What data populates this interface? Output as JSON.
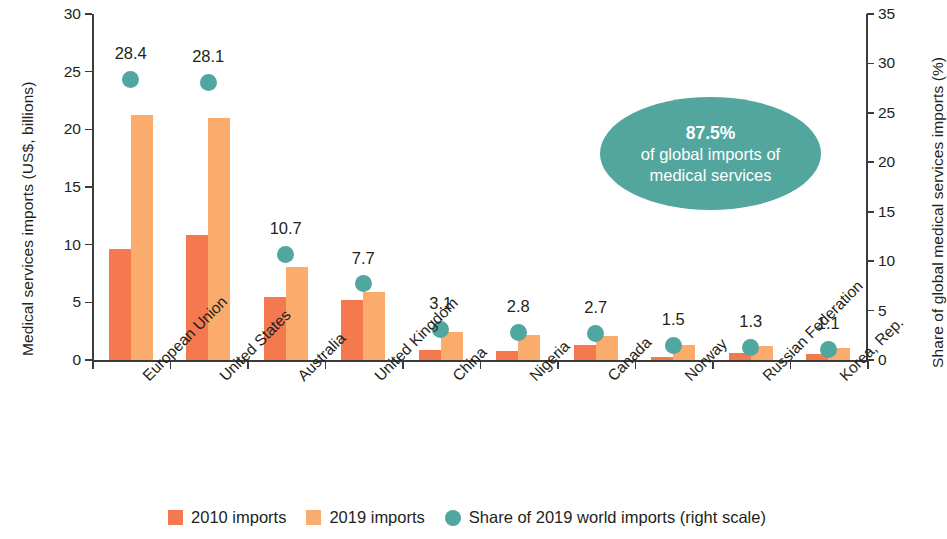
{
  "chart_data": {
    "type": "bar",
    "title": "",
    "subtitle": "",
    "categories": [
      "European Union",
      "United States",
      "Australia",
      "United Kingdom",
      "China",
      "Nigeria",
      "Canada",
      "Norway",
      "Russian Federation",
      "Korea, Rep."
    ],
    "series": [
      {
        "name": "2010 imports",
        "axis": "left",
        "color": "#f4794f",
        "values": [
          9.6,
          10.8,
          5.5,
          5.2,
          0.9,
          0.8,
          1.3,
          0.3,
          0.6,
          0.5
        ]
      },
      {
        "name": "2019 imports",
        "axis": "left",
        "color": "#fbab6b",
        "values": [
          21.2,
          21.0,
          8.1,
          5.9,
          2.4,
          2.2,
          2.1,
          1.3,
          1.2,
          1.0
        ]
      },
      {
        "name": "Share of 2019 world imports (right scale)",
        "axis": "right",
        "color": "#4fa79f",
        "type": "scatter",
        "values": [
          28.4,
          28.1,
          10.7,
          7.7,
          3.1,
          2.8,
          2.7,
          1.5,
          1.3,
          1.1
        ],
        "labels": [
          "28.4",
          "28.1",
          "10.7",
          "7.7",
          "3.1",
          "2.8",
          "2.7",
          "1.5",
          "1.3",
          "1.1"
        ]
      }
    ],
    "ylabel": "Medical services imports (US$, billions)",
    "ylabel_right": "Share of global medical services imports (%)",
    "xlabel": "",
    "ylim": [
      0,
      30
    ],
    "ylim_right": [
      0,
      35
    ],
    "yticks": [
      "0",
      "5",
      "10",
      "15",
      "20",
      "25",
      "30"
    ],
    "yticks_right": [
      "0",
      "5",
      "10",
      "15",
      "20",
      "25",
      "30",
      "35"
    ],
    "grid": false,
    "legend_position": "bottom",
    "annotations": [
      {
        "name": "share-callout",
        "percent": "87.5%",
        "line2": "of global imports of",
        "line3": "medical services",
        "shape": "ellipse",
        "color": "#53a69e"
      }
    ]
  },
  "axes": {
    "left_title": "Medical services imports (US$, billions)",
    "right_title": "Share of global medical services imports (%)"
  },
  "legend": {
    "items": [
      {
        "label": "2010 imports",
        "marker": "square",
        "color": "#f4794f"
      },
      {
        "label": "2019 imports",
        "marker": "square",
        "color": "#fbab6b"
      },
      {
        "label": "Share of 2019 world imports (right scale)",
        "marker": "circle",
        "color": "#4fa79f"
      }
    ]
  },
  "callout": {
    "percent": "87.5%",
    "line2": "of global imports of",
    "line3": "medical services"
  }
}
